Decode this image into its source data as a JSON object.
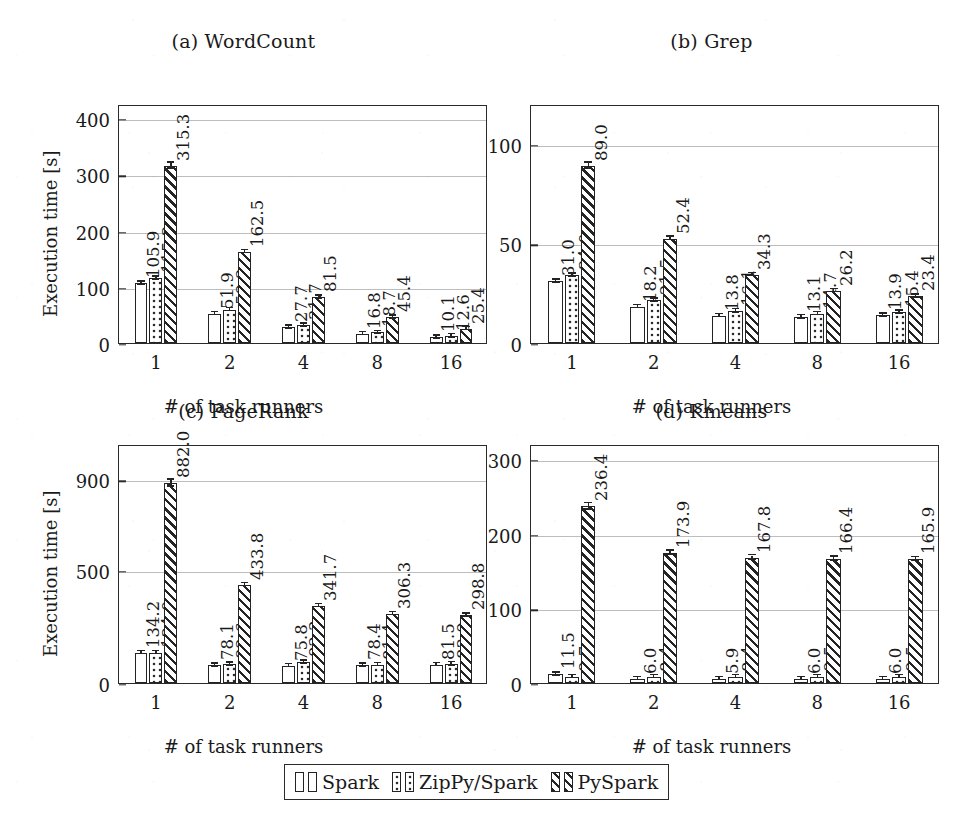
{
  "figure": {
    "background_color": "#ffffff",
    "ink_color": "#232323",
    "grid_color": "#bdbdbd"
  },
  "legend": {
    "entries": [
      {
        "label": "Spark",
        "pattern": "plain"
      },
      {
        "label": "ZipPy/Spark",
        "pattern": "dots"
      },
      {
        "label": "PySpark",
        "pattern": "hatch"
      }
    ]
  },
  "chart_data": [
    {
      "type": "bar",
      "panel": "a",
      "title": "(a) WordCount",
      "xlabel": "# of task runners",
      "ylabel": "Execution time [s]",
      "categories": [
        "1",
        "2",
        "4",
        "8",
        "16"
      ],
      "yticks": [
        0,
        100,
        200,
        300,
        400
      ],
      "ylim": [
        0,
        425
      ],
      "grid": true,
      "legend_position": "bottom-shared",
      "series": [
        {
          "name": "Spark",
          "pattern": "plain",
          "values": [
            105.9,
            51.9,
            27.7,
            16.8,
            10.1
          ]
        },
        {
          "name": "ZipPy/Spark",
          "pattern": "dots",
          "values": [
            115.3,
            59.2,
            31.7,
            18.7,
            12.6
          ]
        },
        {
          "name": "PySpark",
          "pattern": "hatch",
          "values": [
            315.3,
            162.5,
            81.5,
            45.4,
            25.4
          ]
        }
      ]
    },
    {
      "type": "bar",
      "panel": "b",
      "title": "(b) Grep",
      "xlabel": "# of task runners",
      "ylabel": "",
      "categories": [
        "1",
        "2",
        "4",
        "8",
        "16"
      ],
      "yticks": [
        0,
        50,
        100
      ],
      "ylim": [
        0,
        120
      ],
      "grid": true,
      "legend_position": "bottom-shared",
      "series": [
        {
          "name": "Spark",
          "pattern": "plain",
          "values": [
            31.0,
            18.2,
            13.8,
            13.1,
            13.9
          ]
        },
        {
          "name": "ZipPy/Spark",
          "pattern": "dots",
          "values": [
            34.0,
            21.5,
            16.1,
            14.7,
            15.4
          ]
        },
        {
          "name": "PySpark",
          "pattern": "hatch",
          "values": [
            89.0,
            52.4,
            34.3,
            26.2,
            23.4
          ]
        }
      ]
    },
    {
      "type": "bar",
      "panel": "c",
      "title": "(c) PageRank",
      "xlabel": "# of task runners",
      "ylabel": "Execution time [s]",
      "categories": [
        "1",
        "2",
        "4",
        "8",
        "16"
      ],
      "yticks": [
        0,
        500,
        900
      ],
      "ylim": [
        0,
        1055
      ],
      "grid": true,
      "legend_position": "bottom-shared",
      "series": [
        {
          "name": "Spark",
          "pattern": "plain",
          "values": [
            134.2,
            78.1,
            75.8,
            78.4,
            81.5
          ]
        },
        {
          "name": "ZipPy/Spark",
          "pattern": "dots",
          "values": [
            134.0,
            82.6,
            92.2,
            81.4,
            83.9
          ]
        },
        {
          "name": "PySpark",
          "pattern": "hatch",
          "values": [
            882.0,
            433.8,
            341.7,
            306.3,
            298.8
          ]
        }
      ]
    },
    {
      "type": "bar",
      "panel": "d",
      "title": "(d) Kmeans",
      "xlabel": "# of task runners",
      "ylabel": "",
      "categories": [
        "1",
        "2",
        "4",
        "8",
        "16"
      ],
      "yticks": [
        0,
        100,
        200,
        300
      ],
      "ylim": [
        0,
        320
      ],
      "grid": true,
      "legend_position": "bottom-shared",
      "series": [
        {
          "name": "Spark",
          "pattern": "plain",
          "values": [
            11.5,
            6.0,
            5.9,
            6.0,
            6.0
          ]
        },
        {
          "name": "ZipPy/Spark",
          "pattern": "dots",
          "values": [
            8.7,
            8.4,
            8.4,
            8.5,
            8.5
          ]
        },
        {
          "name": "PySpark",
          "pattern": "hatch",
          "values": [
            236.4,
            173.9,
            167.8,
            166.4,
            165.9
          ]
        }
      ]
    }
  ]
}
